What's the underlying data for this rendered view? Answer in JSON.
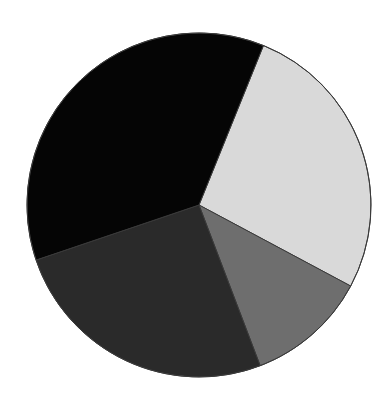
{
  "chart_data": {
    "type": "pie",
    "title": "",
    "legend": null,
    "start_angle_deg": 22,
    "direction": "clockwise",
    "center": [
      199,
      205
    ],
    "radius": 172,
    "stroke": "#3a3a3a",
    "slices": [
      {
        "label": "",
        "value": 26.7,
        "color": "#d9d9d9"
      },
      {
        "label": "",
        "value": 11.4,
        "color": "#6e6e6e"
      },
      {
        "label": "",
        "value": 25.6,
        "color": "#2a2a2a"
      },
      {
        "label": "",
        "value": 36.3,
        "color": "#050505"
      }
    ]
  }
}
